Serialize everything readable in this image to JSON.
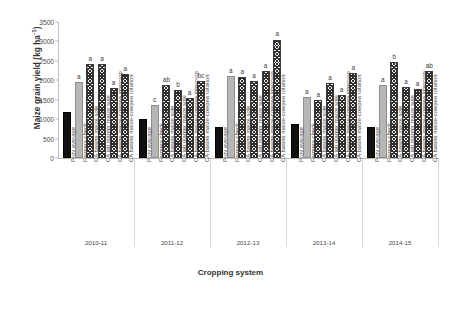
{
  "chart_data": {
    "type": "bar",
    "title": "",
    "xlabel": "Cropping system",
    "ylabel": "Maize grain yield (kg ha⁻¹)",
    "ylabel_main": "Maize grain yield (kg ha",
    "ylabel_sup": "-1",
    "ylabel_tail": ")",
    "ylim": [
      0,
      3500
    ],
    "ytick_step": 500,
    "yticks": [
      "0",
      "500",
      "1000",
      "1500",
      "2000",
      "2500",
      "3000",
      "3500"
    ],
    "grid": false,
    "legend": "none",
    "categories": [
      "Prov average",
      "Farmers check",
      "CA basins maize sole",
      "CA jab planter maize sole",
      "CA basins maize-cowpea intercrop",
      "CA basins maize-cowpea rotation"
    ],
    "group_label_name": "Season",
    "groups": [
      {
        "label": "2010-11",
        "bars": [
          {
            "category": "Prov average",
            "value": 1180,
            "letter": "",
            "style": "solid-dark"
          },
          {
            "category": "Farmers check",
            "value": 1960,
            "letter": "a",
            "style": "solid-light"
          },
          {
            "category": "CA basins maize sole",
            "value": 2420,
            "letter": "a",
            "style": "hatch"
          },
          {
            "category": "CA jab planter maize sole",
            "value": 2430,
            "letter": "a",
            "style": "hatch"
          },
          {
            "category": "CA basins maize-cowpea intercrop",
            "value": 1790,
            "letter": "a",
            "style": "hatch"
          },
          {
            "category": "CA basins maize-cowpea rotation",
            "value": 2170,
            "letter": "a",
            "style": "hatch"
          }
        ]
      },
      {
        "label": "2011-12",
        "bars": [
          {
            "category": "Prov average",
            "value": 1000,
            "letter": "",
            "style": "solid-dark"
          },
          {
            "category": "Farmers check",
            "value": 1370,
            "letter": "c",
            "style": "solid-light"
          },
          {
            "category": "CA basins maize sole",
            "value": 1880,
            "letter": "ab",
            "style": "hatch"
          },
          {
            "category": "CA jab planter maize sole",
            "value": 1740,
            "letter": "b",
            "style": "hatch"
          },
          {
            "category": "CA basins maize-cowpea intercrop",
            "value": 1540,
            "letter": "a",
            "style": "hatch"
          },
          {
            "category": "CA basins maize-cowpea rotation",
            "value": 1990,
            "letter": "bc",
            "style": "hatch"
          }
        ]
      },
      {
        "label": "2012-13",
        "bars": [
          {
            "category": "Prov average",
            "value": 800,
            "letter": "",
            "style": "solid-dark"
          },
          {
            "category": "Farmers check",
            "value": 2100,
            "letter": "a",
            "style": "solid-light"
          },
          {
            "category": "CA basins maize sole",
            "value": 2080,
            "letter": "a",
            "style": "hatch"
          },
          {
            "category": "CA jab planter maize sole",
            "value": 1970,
            "letter": "a",
            "style": "hatch"
          },
          {
            "category": "CA basins maize-cowpea intercrop",
            "value": 2250,
            "letter": "a",
            "style": "hatch"
          },
          {
            "category": "CA basins maize-cowpea rotation",
            "value": 3050,
            "letter": "a",
            "style": "hatch"
          }
        ]
      },
      {
        "label": "2013-14",
        "bars": [
          {
            "category": "Prov average",
            "value": 870,
            "letter": "",
            "style": "solid-dark"
          },
          {
            "category": "Farmers check",
            "value": 1570,
            "letter": "a",
            "style": "solid-light"
          },
          {
            "category": "CA basins maize sole",
            "value": 1490,
            "letter": "a",
            "style": "hatch"
          },
          {
            "category": "CA jab planter maize sole",
            "value": 1930,
            "letter": "a",
            "style": "hatch"
          },
          {
            "category": "CA basins maize-cowpea intercrop",
            "value": 1620,
            "letter": "a",
            "style": "hatch"
          },
          {
            "category": "CA basins maize-cowpea rotation",
            "value": 2180,
            "letter": "a",
            "style": "hatch"
          }
        ]
      },
      {
        "label": "2014-15",
        "bars": [
          {
            "category": "Prov average",
            "value": 790,
            "letter": "",
            "style": "solid-dark"
          },
          {
            "category": "Farmers check",
            "value": 1870,
            "letter": "a",
            "style": "solid-light"
          },
          {
            "category": "CA basins maize sole",
            "value": 2480,
            "letter": "b",
            "style": "hatch"
          },
          {
            "category": "CA jab planter maize sole",
            "value": 1830,
            "letter": "a",
            "style": "hatch"
          },
          {
            "category": "CA basins maize-cowpea intercrop",
            "value": 1780,
            "letter": "a",
            "style": "hatch"
          },
          {
            "category": "CA basins maize-cowpea rotation",
            "value": 2240,
            "letter": "ab",
            "style": "hatch"
          }
        ]
      }
    ]
  }
}
